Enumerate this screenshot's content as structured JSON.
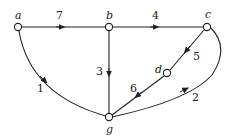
{
  "diagram": {
    "type": "directed-weighted-graph",
    "colors": {
      "stroke": "#222222",
      "node_fill": "#ffffff",
      "background": "#ffffff"
    },
    "nodes": [
      {
        "id": "a",
        "label": "a",
        "x": 18,
        "y": 27
      },
      {
        "id": "b",
        "label": "b",
        "x": 109,
        "y": 27
      },
      {
        "id": "c",
        "label": "c",
        "x": 207,
        "y": 27
      },
      {
        "id": "d",
        "label": "d",
        "x": 167,
        "y": 73
      },
      {
        "id": "g",
        "label": "g",
        "x": 109,
        "y": 117
      }
    ],
    "edges": [
      {
        "from": "a",
        "to": "b",
        "weight": "7"
      },
      {
        "from": "b",
        "to": "c",
        "weight": "4"
      },
      {
        "from": "b",
        "to": "g",
        "weight": "3"
      },
      {
        "from": "a",
        "to": "g",
        "weight": "1"
      },
      {
        "from": "c",
        "to": "d",
        "weight": "5"
      },
      {
        "from": "d",
        "to": "g",
        "weight": "6"
      },
      {
        "from": "g",
        "to": "c",
        "weight": "2"
      }
    ]
  }
}
